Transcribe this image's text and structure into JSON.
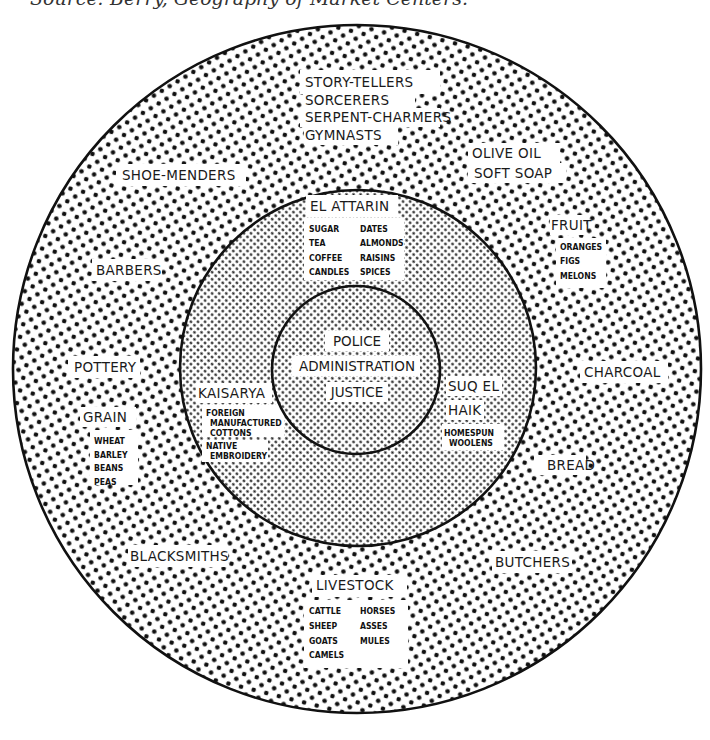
{
  "caption": "Source: Berry, Geography of Market Centers.",
  "colors": {
    "ink": "#111111",
    "paper": "#ffffff"
  },
  "diagram": {
    "rings": [
      {
        "name": "outer",
        "pattern": "coarse-dots"
      },
      {
        "name": "middle",
        "pattern": "fine-dots"
      },
      {
        "name": "core",
        "pattern": "fine-dots"
      }
    ],
    "core": {
      "lines": [
        "POLICE",
        "ADMINISTRATION",
        "JUSTICE"
      ]
    },
    "middle_zone": {
      "el_attarin": {
        "label": "EL ATTARIN",
        "items_left": [
          "SUGAR",
          "TEA",
          "COFFEE",
          "CANDLES"
        ],
        "items_right": [
          "DATES",
          "ALMONDS",
          "RAISINS",
          "SPICES"
        ]
      },
      "kaisarya": {
        "label": "KAISARYA",
        "items": [
          "FOREIGN",
          "MANUFACTURED",
          "COTTONS",
          "NATIVE",
          "EMBROIDERY"
        ]
      },
      "suq_el_haik": {
        "label_line1": "SUQ EL",
        "label_line2": "HAIK",
        "items": [
          "HOMESPUN",
          "WOOLENS"
        ]
      }
    },
    "outer_zone": {
      "entertainers": [
        "STORY-TELLERS",
        "SORCERERS",
        "SERPENT-CHARMERS",
        "GYMNASTS"
      ],
      "shoe_menders": "SHOE-MENDERS",
      "olive_oil": "OLIVE OIL",
      "soft_soap": "SOFT SOAP",
      "fruit": {
        "label": "FRUIT",
        "items": [
          "ORANGES",
          "FIGS",
          "MELONS"
        ]
      },
      "barbers": "BARBERS",
      "pottery": "POTTERY",
      "charcoal": "CHARCOAL",
      "grain": {
        "label": "GRAIN",
        "items": [
          "WHEAT",
          "BARLEY",
          "BEANS",
          "PEAS"
        ]
      },
      "bread": "BREAD",
      "blacksmiths": "BLACKSMITHS",
      "butchers": "BUTCHERS",
      "livestock": {
        "label": "LIVESTOCK",
        "items_left": [
          "CATTLE",
          "SHEEP",
          "GOATS",
          "CAMELS"
        ],
        "items_right": [
          "HORSES",
          "ASSES",
          "MULES"
        ]
      }
    }
  }
}
